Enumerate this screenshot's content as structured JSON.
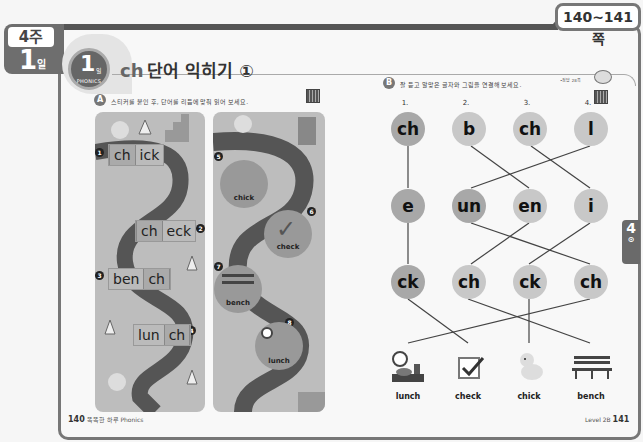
{
  "week_tab": {
    "week": "4주",
    "day_number": "1",
    "day_label": "일"
  },
  "page_tab": {
    "label": "140~141쪽"
  },
  "title": {
    "day_number": "1",
    "day_label": "일",
    "category": "PHONICS",
    "prefix": "ch",
    "text": "단어 익히기 ①"
  },
  "header_right": {
    "label": "•정답 28쪽"
  },
  "section_a": {
    "badge": "A",
    "instruction": "스티커를 붙인 후, 단어를 리듬에 맞춰 읽어 보세요.",
    "left_panel": {
      "items": [
        {
          "num": "1",
          "parts": [
            "ch",
            "ick"
          ],
          "highlight": 0
        },
        {
          "num": "2",
          "parts": [
            "ch",
            "eck"
          ],
          "highlight": 0
        },
        {
          "num": "3",
          "parts": [
            "ben",
            "ch"
          ],
          "highlight": 1
        },
        {
          "num": "4",
          "parts": [
            "lun",
            "ch"
          ],
          "highlight": 1
        }
      ]
    },
    "right_panel": {
      "items": [
        {
          "num": "5",
          "label": "chick",
          "icon": "chick-icon"
        },
        {
          "num": "6",
          "label": "check",
          "icon": "checkmark-icon"
        },
        {
          "num": "7",
          "label": "bench",
          "icon": "bench-icon"
        },
        {
          "num": "8",
          "label": "lunch",
          "icon": "lunch-tray-icon"
        }
      ]
    }
  },
  "section_b": {
    "badge": "B",
    "instruction": "잘 듣고 알맞은 글자와 그림을 연결해 보세요.",
    "columns": [
      "1.",
      "2.",
      "3.",
      "4."
    ],
    "row1": [
      "ch",
      "b",
      "ch",
      "l"
    ],
    "row2": [
      "e",
      "un",
      "en",
      "i"
    ],
    "row3": [
      "ck",
      "ch",
      "ck",
      "ch"
    ],
    "pictures": [
      {
        "label": "lunch",
        "icon": "lunch-tray-icon"
      },
      {
        "label": "check",
        "icon": "checkbox-icon"
      },
      {
        "label": "chick",
        "icon": "chick-icon"
      },
      {
        "label": "bench",
        "icon": "bench-icon"
      }
    ]
  },
  "side_tab": {
    "number": "4",
    "sub": "⊙"
  },
  "footer": {
    "left_page": "140",
    "left_text": "똑똑한 하루 Phonics",
    "right_text": "Level 2B",
    "right_page": "141"
  }
}
